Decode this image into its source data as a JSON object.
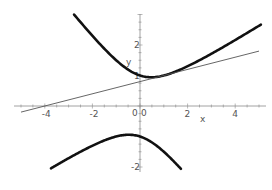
{
  "chart_data": {
    "type": "line",
    "title": "",
    "xlabel": "x",
    "ylabel": "y",
    "xlim": [
      -5.1,
      5.2
    ],
    "ylim": [
      -2.1,
      3.0
    ],
    "grid": false,
    "legend": null,
    "x_ticks": [
      -4,
      -2,
      0,
      2,
      4
    ],
    "x_tick_labels": [
      "-4",
      "-2",
      "0",
      "2",
      "4"
    ],
    "y_ticks": [
      -2,
      -1,
      1,
      2
    ],
    "y_tick_labels": [
      "-2",
      "1",
      "2"
    ],
    "origin_labels": [
      "0",
      "0"
    ],
    "series": [
      {
        "name": "hyperbola upper branch (y^2 + 0.5xy - 0.5x^2 = 1)",
        "style": "thick",
        "x": [
          -2.77,
          -2.0,
          -1.5,
          -1.0,
          -0.5,
          0.0,
          0.5,
          1.0,
          1.5,
          2.0,
          3.0,
          4.0,
          5.08
        ],
        "y": [
          3.0,
          2.31,
          1.88,
          1.5,
          1.2,
          1.0,
          0.94,
          1.0,
          1.16,
          1.39,
          1.91,
          2.46,
          2.63
        ]
      },
      {
        "name": "hyperbola lower branch",
        "style": "thick",
        "x": [
          -3.74,
          -3.0,
          -2.0,
          -1.5,
          -1.0,
          -0.5,
          0.0,
          0.5,
          1.0,
          1.5,
          1.72
        ],
        "y": [
          -2.04,
          -1.91,
          -1.39,
          -1.16,
          -1.0,
          -0.94,
          -1.0,
          -1.2,
          -1.5,
          -1.88,
          -2.04
        ]
      },
      {
        "name": "tangent line y = 0.2x + 0.8",
        "style": "thin",
        "x": [
          -5.0,
          5.0
        ],
        "y": [
          -0.2,
          1.8
        ]
      }
    ]
  },
  "axes": {
    "x_label": "x",
    "y_label": "y"
  }
}
